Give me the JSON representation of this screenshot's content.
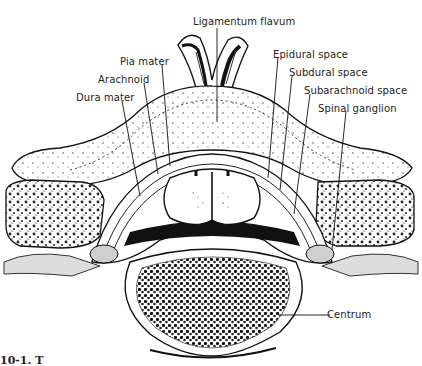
{
  "figure": {
    "labels": {
      "ligamentum_flavum": "Ligamentum flavum",
      "pia_mater": "Pia mater",
      "arachnoid": "Arachnoid",
      "dura_mater": "Dura mater",
      "epidural_space": "Epidural space",
      "subdural_space": "Subdural space",
      "subarachnoid_space": "Subarachnoid space",
      "spinal_ganglion": "Spinal ganglion",
      "centrum": "Centrum"
    },
    "caption": "10-1.  T"
  }
}
